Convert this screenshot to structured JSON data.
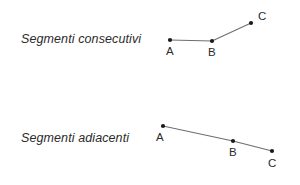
{
  "figure": {
    "background_color": "#ffffff",
    "line_color": "#6e6e6e",
    "dot_color": "#1a1a1a",
    "text_color": "#2b2b2b",
    "width": 300,
    "height": 185,
    "diagrams": [
      {
        "id": "consecutivi",
        "caption": "Segmenti consecutivi",
        "caption_x": 21,
        "caption_y": 32,
        "points": [
          {
            "label": "A",
            "x": 170,
            "y": 40,
            "label_x": 166,
            "label_y": 45
          },
          {
            "label": "B",
            "x": 212,
            "y": 41,
            "label_x": 208,
            "label_y": 46
          },
          {
            "label": "C",
            "x": 251,
            "y": 23,
            "label_x": 258,
            "label_y": 10
          }
        ],
        "segments": [
          {
            "from": "A",
            "to": "B"
          },
          {
            "from": "B",
            "to": "C"
          }
        ]
      },
      {
        "id": "adiacenti",
        "caption": "Segmenti adiacenti",
        "caption_x": 21,
        "caption_y": 131,
        "points": [
          {
            "label": "A",
            "x": 163,
            "y": 126,
            "label_x": 156,
            "label_y": 131
          },
          {
            "label": "B",
            "x": 233,
            "y": 141,
            "label_x": 229,
            "label_y": 146
          },
          {
            "label": "C",
            "x": 272,
            "y": 151,
            "label_x": 268,
            "label_y": 157
          }
        ],
        "segments": [
          {
            "from": "A",
            "to": "B"
          },
          {
            "from": "B",
            "to": "C"
          }
        ]
      }
    ]
  }
}
